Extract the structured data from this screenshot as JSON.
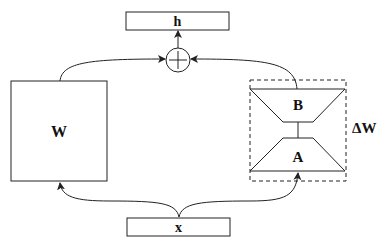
{
  "diagram": {
    "type": "LoRA reparameterization",
    "nodes": {
      "output": {
        "label": "h"
      },
      "sum": {
        "label": "+",
        "icon": "plus-circle"
      },
      "pretrained_weight": {
        "label": "W"
      },
      "lora_b": {
        "label": "B"
      },
      "lora_a": {
        "label": "A"
      },
      "delta": {
        "label": "ΔW"
      },
      "input": {
        "label": "x"
      }
    },
    "edges": [
      {
        "from": "x",
        "to": "W"
      },
      {
        "from": "x",
        "to": "A"
      },
      {
        "from": "A",
        "to": "B"
      },
      {
        "from": "W",
        "to": "sum"
      },
      {
        "from": "B",
        "to": "sum"
      },
      {
        "from": "sum",
        "to": "h"
      }
    ],
    "colors": {
      "stroke": "#222222",
      "background": "#ffffff"
    }
  }
}
